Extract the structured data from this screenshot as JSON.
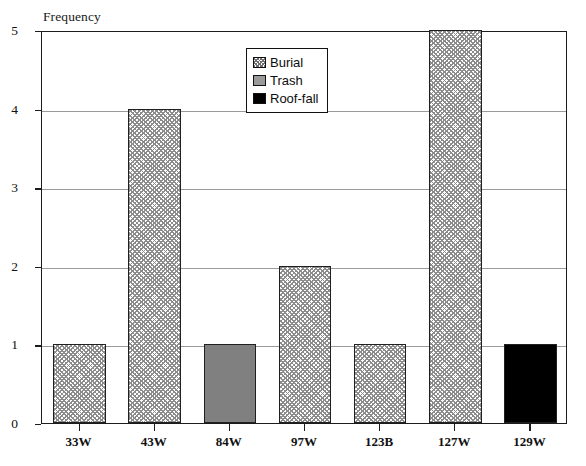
{
  "chart_data": {
    "type": "bar",
    "title": "",
    "xlabel": "",
    "ylabel": "Frequency",
    "categories": [
      "33W",
      "43W",
      "84W",
      "97W",
      "123B",
      "127W",
      "129W"
    ],
    "values": [
      1,
      4,
      1,
      2,
      1,
      5,
      1
    ],
    "point_series": [
      "Burial",
      "Burial",
      "Trash",
      "Burial",
      "Burial",
      "Burial",
      "Roof-fall"
    ],
    "series": [
      {
        "name": "Burial",
        "values": [
          1,
          4,
          null,
          2,
          1,
          5,
          null
        ]
      },
      {
        "name": "Trash",
        "values": [
          null,
          null,
          1,
          null,
          null,
          null,
          null
        ]
      },
      {
        "name": "Roof-fall",
        "values": [
          null,
          null,
          null,
          null,
          null,
          null,
          1
        ]
      }
    ],
    "ylim": [
      0,
      5
    ],
    "yticks": [
      0,
      1,
      2,
      3,
      4,
      5
    ],
    "ytick_labels": [
      "0",
      "1",
      "2",
      "3",
      "4",
      "5"
    ],
    "gridlines": [
      1,
      2,
      3,
      4
    ],
    "grid": true,
    "legend_position": "top-center-left"
  },
  "axis": {
    "y_title": "Frequency",
    "y_tick_labels": [
      "0",
      "1",
      "2",
      "3",
      "4",
      "5"
    ],
    "x_tick_labels": [
      "33W",
      "43W",
      "84W",
      "97W",
      "123B",
      "127W",
      "129W"
    ]
  },
  "legend": {
    "entries": [
      {
        "label": "Burial",
        "fill": "hatch",
        "color": "#8c8c8c"
      },
      {
        "label": "Trash",
        "fill": "gray",
        "color": "#808080"
      },
      {
        "label": "Roof-fall",
        "fill": "black",
        "color": "#000000"
      }
    ]
  },
  "colors": {
    "axis": "#1c1c1c",
    "gridline": "#9a9a9a",
    "bar_border": "#202020",
    "background": "#ffffff"
  }
}
